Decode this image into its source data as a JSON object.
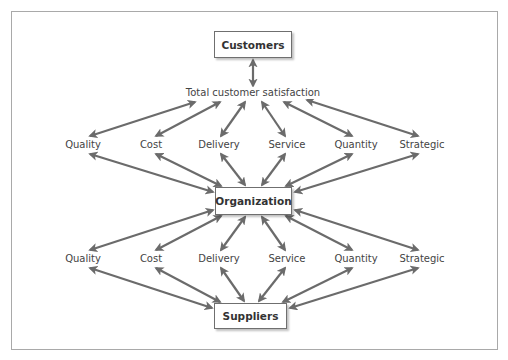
{
  "diagram": {
    "arrow_color": "#6b6b6b",
    "boxes": {
      "customers": {
        "label": "Customers",
        "x": 214,
        "y": 31,
        "w": 78,
        "h": 27
      },
      "organization": {
        "label": "Organization",
        "x": 215,
        "y": 187,
        "w": 77,
        "h": 28
      },
      "suppliers": {
        "label": "Suppliers",
        "x": 214,
        "y": 303,
        "w": 73,
        "h": 26
      }
    },
    "satisfaction": {
      "label": "Total customer satisfaction",
      "x": 253,
      "y": 93
    },
    "upper_row": {
      "y": 145,
      "items": [
        {
          "label": "Quality",
          "x": 83
        },
        {
          "label": "Cost",
          "x": 151
        },
        {
          "label": "Delivery",
          "x": 219
        },
        {
          "label": "Service",
          "x": 287
        },
        {
          "label": "Quantity",
          "x": 356
        },
        {
          "label": "Strategic",
          "x": 422
        }
      ]
    },
    "lower_row": {
      "y": 259,
      "items": [
        {
          "label": "Quality",
          "x": 83
        },
        {
          "label": "Cost",
          "x": 151
        },
        {
          "label": "Delivery",
          "x": 219
        },
        {
          "label": "Service",
          "x": 287
        },
        {
          "label": "Quantity",
          "x": 356
        },
        {
          "label": "Strategic",
          "x": 422
        }
      ]
    },
    "arrows": [
      [
        253,
        60,
        253,
        86
      ],
      [
        195,
        102,
        90,
        136
      ],
      [
        220,
        102,
        156,
        136
      ],
      [
        245,
        102,
        221,
        136
      ],
      [
        262,
        102,
        285,
        136
      ],
      [
        284,
        102,
        352,
        136
      ],
      [
        307,
        100,
        418,
        136
      ],
      [
        90,
        154,
        213,
        192
      ],
      [
        156,
        154,
        221,
        186
      ],
      [
        221,
        154,
        245,
        185
      ],
      [
        285,
        154,
        262,
        185
      ],
      [
        352,
        154,
        286,
        186
      ],
      [
        418,
        154,
        295,
        192
      ],
      [
        213,
        210,
        90,
        250
      ],
      [
        221,
        216,
        156,
        250
      ],
      [
        245,
        217,
        221,
        250
      ],
      [
        262,
        217,
        285,
        250
      ],
      [
        286,
        216,
        352,
        250
      ],
      [
        295,
        210,
        418,
        250
      ],
      [
        90,
        268,
        212,
        308
      ],
      [
        156,
        268,
        220,
        302
      ],
      [
        221,
        268,
        244,
        301
      ],
      [
        285,
        268,
        259,
        301
      ],
      [
        352,
        268,
        283,
        302
      ],
      [
        418,
        268,
        290,
        308
      ]
    ]
  }
}
